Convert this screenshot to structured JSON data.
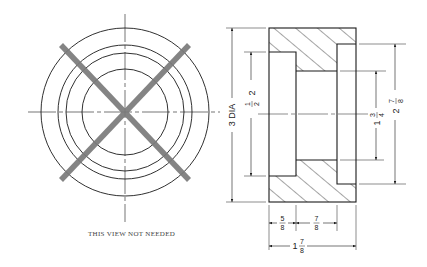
{
  "drawing": {
    "type": "orthographic technical drawing",
    "colors": {
      "line": "#1a1a1a",
      "cross": "#7a7a7a",
      "text": "#222222",
      "background": "#ffffff"
    },
    "front_view": {
      "description": "circular view with four concentric circles and center lines, crossed out",
      "circles": 4,
      "crossed_out": true,
      "note": "THIS VIEW NOT NEEDED"
    },
    "section_view": {
      "hatched": true,
      "dimensions": {
        "overall_diameter": "3 DIA",
        "left_counterbore_diameter": "2 1/2",
        "left_counterbore_whole": "2",
        "left_counterbore_num": "1",
        "left_counterbore_den": "2",
        "through_hole_diameter": "1 3/4",
        "through_hole_whole": "1",
        "through_hole_num": "3",
        "through_hole_den": "4",
        "right_counterbore_diameter": "2 7/8",
        "right_counterbore_whole": "2",
        "right_counterbore_num": "7",
        "right_counterbore_den": "8",
        "left_counterbore_depth": "5/8",
        "left_depth_num": "5",
        "left_depth_den": "8",
        "through_hole_length": "7/8",
        "hole_len_num": "7",
        "hole_len_den": "8",
        "overall_length": "1 7/8",
        "overall_len_whole": "1",
        "overall_len_num": "7",
        "overall_len_den": "8"
      }
    }
  }
}
